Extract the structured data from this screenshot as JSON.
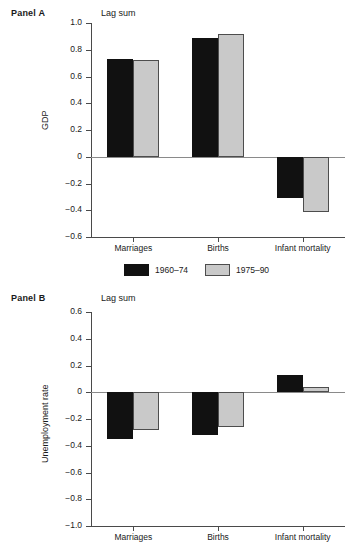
{
  "figure": {
    "background": "#ffffff",
    "bar_colors": {
      "series_1": "#111111",
      "series_2": "#c9c9c9",
      "series_2_border": "#4d4d4d"
    }
  },
  "legend": {
    "position": "between-panels",
    "entries": [
      {
        "label": "1960–74",
        "swatch": "dark-swatch"
      },
      {
        "label": "1975–90",
        "swatch": "light-swatch"
      }
    ]
  },
  "panels": [
    {
      "id": "panel-a",
      "label": "Panel A",
      "annotation": "Lag sum",
      "ylabel": "GDP"
    },
    {
      "id": "panel-b",
      "label": "Panel B",
      "annotation": "Lag sum",
      "ylabel": "Unemployment rate"
    }
  ],
  "chart_data": [
    {
      "type": "bar",
      "id": "panel-a",
      "title": "Panel A",
      "annotation": "Lag sum",
      "xlabel": "",
      "ylabel": "GDP",
      "categories": [
        "Marriages",
        "Births",
        "Infant mortality"
      ],
      "series": [
        {
          "name": "1960–74",
          "color": "#111111",
          "values": [
            0.73,
            0.89,
            -0.31
          ]
        },
        {
          "name": "1975–90",
          "color": "#c9c9c9",
          "values": [
            0.72,
            0.92,
            -0.41
          ]
        }
      ],
      "ylim": [
        -0.6,
        1.0
      ],
      "yticks": [
        1.0,
        0.8,
        0.6,
        0.4,
        0.2,
        0,
        -0.2,
        -0.4,
        -0.6
      ],
      "ytick_labels": [
        "1.0",
        "0.8",
        "0.6",
        "0.4",
        "0.2",
        "0",
        "−0.2",
        "−0.4",
        "−0.6"
      ],
      "grid": false,
      "legend_position": "below"
    },
    {
      "type": "bar",
      "id": "panel-b",
      "title": "Panel B",
      "annotation": "Lag sum",
      "xlabel": "",
      "ylabel": "Unemployment rate",
      "categories": [
        "Marriages",
        "Births",
        "Infant mortality"
      ],
      "series": [
        {
          "name": "1960–74",
          "color": "#111111",
          "values": [
            -0.35,
            -0.32,
            0.13
          ]
        },
        {
          "name": "1975–90",
          "color": "#c9c9c9",
          "values": [
            -0.28,
            -0.26,
            0.04
          ]
        }
      ],
      "ylim": [
        -1.0,
        0.6
      ],
      "yticks": [
        0.6,
        0.4,
        0.2,
        0,
        -0.2,
        -0.4,
        -0.6,
        -0.8,
        -1.0
      ],
      "ytick_labels": [
        "0.6",
        "0.4",
        "0.2",
        "0",
        "−0.2",
        "−0.4",
        "−0.6",
        "−0.8",
        "−1.0"
      ],
      "grid": false,
      "legend_position": "above"
    }
  ]
}
